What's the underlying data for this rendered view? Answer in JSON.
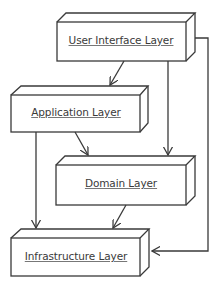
{
  "diagram": {
    "type": "layered-architecture",
    "stroke_color": "#3a3a3a",
    "background": "#ffffff",
    "layers": [
      {
        "id": "ui",
        "label": "User Interface Layer"
      },
      {
        "id": "app",
        "label": "Application Layer"
      },
      {
        "id": "domain",
        "label": "Domain Layer"
      },
      {
        "id": "infra",
        "label": "Infrastructure Layer"
      }
    ],
    "dependencies": [
      {
        "from": "User Interface Layer",
        "to": "Application Layer"
      },
      {
        "from": "User Interface Layer",
        "to": "Domain Layer"
      },
      {
        "from": "User Interface Layer",
        "to": "Infrastructure Layer"
      },
      {
        "from": "Application Layer",
        "to": "Domain Layer"
      },
      {
        "from": "Application Layer",
        "to": "Infrastructure Layer"
      },
      {
        "from": "Domain Layer",
        "to": "Infrastructure Layer"
      }
    ]
  }
}
